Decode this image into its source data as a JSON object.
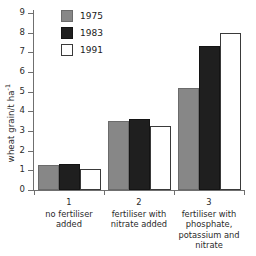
{
  "chart_data": {
    "type": "bar",
    "title": "",
    "xlabel": "",
    "ylabel": "wheat grain/t ha",
    "ylabel_exponent": "-1",
    "ylim": [
      0,
      9
    ],
    "yticks": [
      0,
      1,
      2,
      3,
      4,
      5,
      6,
      7,
      8,
      9
    ],
    "ytick_labels": [
      "0",
      "1",
      "2",
      "3",
      "4",
      "5",
      "6",
      "7",
      "8",
      "9"
    ],
    "grid": false,
    "legend_position": "top-left-inside",
    "categories": [
      "1",
      "2",
      "3"
    ],
    "category_descriptions": [
      "no fertiliser added",
      "fertiliser with nitrate added",
      "fertiliser with phosphate, potassium and nitrate"
    ],
    "series": [
      {
        "name": "1975",
        "color": "#878787",
        "values": [
          1.25,
          3.5,
          5.2
        ]
      },
      {
        "name": "1983",
        "color": "#1f1f1f",
        "values": [
          1.3,
          3.6,
          7.3
        ]
      },
      {
        "name": "1991",
        "color": "#ffffff",
        "values": [
          1.05,
          3.25,
          8.0
        ]
      }
    ]
  },
  "legend": {
    "items": [
      {
        "label": "1975",
        "swatch": "c1975"
      },
      {
        "label": "1983",
        "swatch": "c1983"
      },
      {
        "label": "1991",
        "swatch": "c1991"
      }
    ]
  },
  "axis": {
    "y_title_text": "wheat grain/t ha",
    "y_title_exponent": "-1"
  },
  "category_labels": [
    {
      "number": "1",
      "lines": [
        "no fertiliser",
        "added"
      ]
    },
    {
      "number": "2",
      "lines": [
        "fertiliser with",
        "nitrate added"
      ]
    },
    {
      "number": "3",
      "lines": [
        "fertiliser with",
        "phosphate,",
        "potassium and",
        "nitrate"
      ]
    }
  ],
  "caption": {
    "lines": [
      "Yield",
      "with i",
      "until s",
      "be"
    ],
    "note": "caption text is clipped by the right edge of the screenshot"
  }
}
